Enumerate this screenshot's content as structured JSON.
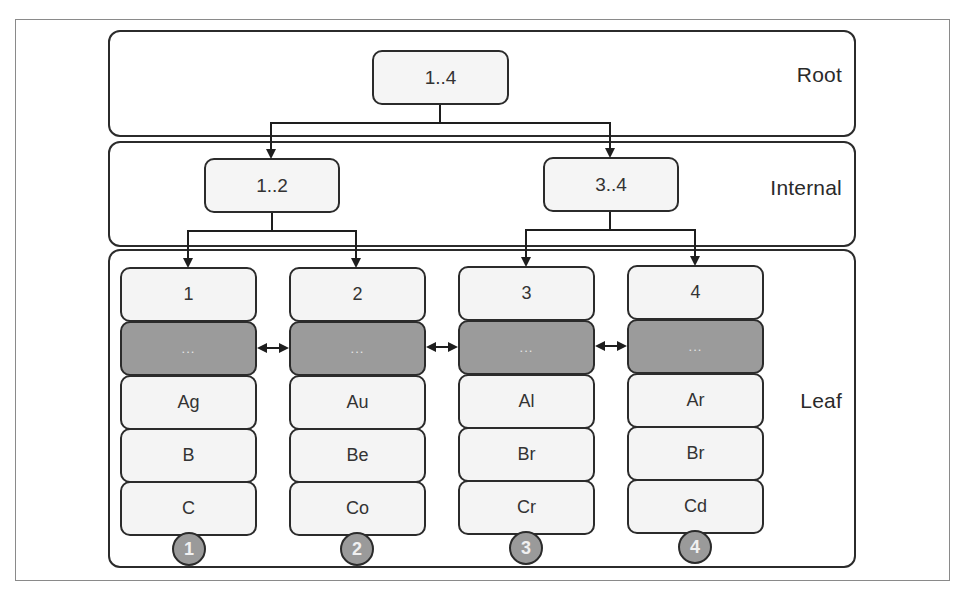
{
  "diagram": {
    "type": "b-tree",
    "levels": [
      {
        "id": "root",
        "label": "Root"
      },
      {
        "id": "internal",
        "label": "Internal"
      },
      {
        "id": "leaf",
        "label": "Leaf"
      }
    ],
    "root": {
      "label": "1..4"
    },
    "internal": [
      {
        "label": "1..2"
      },
      {
        "label": "3..4"
      }
    ],
    "leaves": [
      {
        "header": "1",
        "sibling_pointer": "...",
        "keys": [
          "Ag",
          "B",
          "C"
        ],
        "badge": "1"
      },
      {
        "header": "2",
        "sibling_pointer": "...",
        "keys": [
          "Au",
          "Be",
          "Co"
        ],
        "badge": "2"
      },
      {
        "header": "3",
        "sibling_pointer": "...",
        "keys": [
          "Al",
          "Br",
          "Cr"
        ],
        "badge": "3"
      },
      {
        "header": "4",
        "sibling_pointer": "...",
        "keys": [
          "Ar",
          "Br",
          "Cd"
        ],
        "badge": "4"
      }
    ],
    "colors": {
      "node_fill": "#f5f5f5",
      "pointer_fill": "#9b9b9b",
      "stroke": "#2b2b2b",
      "badge_fill": "#9a9a9a"
    }
  }
}
